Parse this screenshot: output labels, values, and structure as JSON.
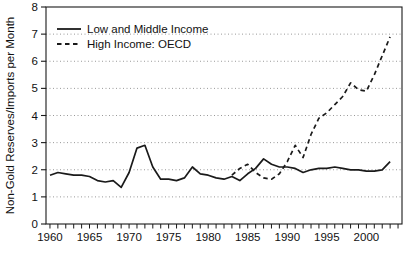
{
  "figure": {
    "background_color": "#ffffff",
    "axis_color": "#1a1a1a",
    "grid_color": "#999999"
  },
  "chart_data": {
    "type": "line",
    "title": "",
    "xlabel": "",
    "ylabel": "Non-Gold Reserves/Imports per Month",
    "xlim": [
      1959.5,
      2004.5
    ],
    "ylim": [
      0,
      8
    ],
    "yticks": [
      0,
      1,
      2,
      3,
      4,
      5,
      6,
      7,
      8
    ],
    "xticks_major": [
      1960,
      1965,
      1970,
      1975,
      1980,
      1985,
      1990,
      1995,
      2000
    ],
    "xticks_minor_start": 1960,
    "xticks_minor_end": 2004,
    "gridlines_y": [
      1,
      2,
      3,
      4,
      5,
      6,
      7
    ],
    "grid_on": true,
    "legend_position": "top-left",
    "line_color": "#1a1a1a",
    "series": [
      {
        "name": "Low and Middle Income",
        "line_style": "solid",
        "x": [
          1960,
          1961,
          1962,
          1963,
          1964,
          1965,
          1966,
          1967,
          1968,
          1969,
          1970,
          1971,
          1972,
          1973,
          1974,
          1975,
          1976,
          1977,
          1978,
          1979,
          1980,
          1981,
          1982,
          1983,
          1984,
          1985,
          1986,
          1987,
          1988,
          1989,
          1990,
          1991,
          1992,
          1993,
          1994,
          1995,
          1996,
          1997,
          1998,
          1999,
          2000,
          2001,
          2002,
          2003
        ],
        "y": [
          1.8,
          1.9,
          1.85,
          1.8,
          1.8,
          1.75,
          1.6,
          1.55,
          1.6,
          1.35,
          1.9,
          2.8,
          2.9,
          2.1,
          1.65,
          1.65,
          1.6,
          1.7,
          2.1,
          1.85,
          1.8,
          1.7,
          1.65,
          1.75,
          1.6,
          1.85,
          2.05,
          2.4,
          2.2,
          2.1,
          2.1,
          2.05,
          1.9,
          2.0,
          2.05,
          2.05,
          2.1,
          2.05,
          2.0,
          2.0,
          1.95,
          1.95,
          2.0,
          2.3
        ]
      },
      {
        "name": "High Income: OECD",
        "line_style": "dashed",
        "x": [
          1983,
          1984,
          1985,
          1986,
          1987,
          1988,
          1989,
          1990,
          1991,
          1992,
          1993,
          1994,
          1995,
          1996,
          1997,
          1998,
          1999,
          2000,
          2001,
          2002,
          2003
        ],
        "y": [
          1.8,
          2.05,
          2.2,
          1.9,
          1.7,
          1.65,
          1.85,
          2.3,
          2.9,
          2.45,
          3.3,
          3.9,
          4.1,
          4.4,
          4.7,
          5.2,
          4.95,
          4.9,
          5.5,
          6.2,
          6.9
        ]
      }
    ]
  }
}
